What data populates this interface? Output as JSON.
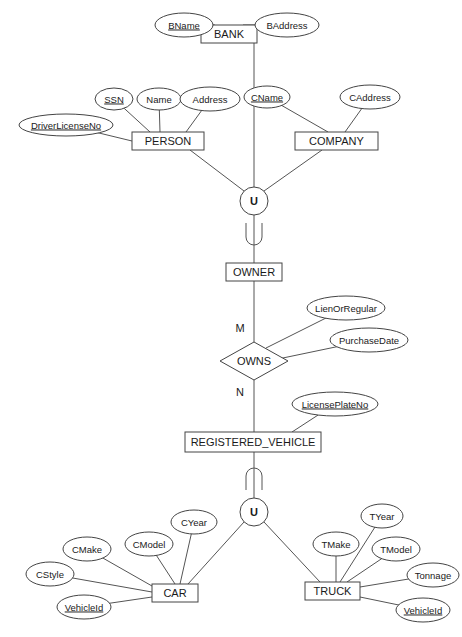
{
  "diagram": {
    "type": "EER diagram",
    "colors": {
      "stroke": "#444444",
      "text": "#1a1a1a",
      "background": "#ffffff"
    },
    "entities": [
      {
        "id": "bank",
        "label": "BANK",
        "x": 201,
        "y": 25,
        "w": 56,
        "h": 18
      },
      {
        "id": "person",
        "label": "PERSON",
        "x": 132,
        "y": 132,
        "w": 72,
        "h": 18
      },
      {
        "id": "company",
        "label": "COMPANY",
        "x": 295,
        "y": 132,
        "w": 83,
        "h": 18
      },
      {
        "id": "owner",
        "label": "OWNER",
        "x": 226,
        "y": 263,
        "w": 56,
        "h": 18
      },
      {
        "id": "registered_vehicle",
        "label": "REGISTERED_VEHICLE",
        "x": 185,
        "y": 432,
        "w": 136,
        "h": 20
      },
      {
        "id": "car",
        "label": "CAR",
        "x": 152,
        "y": 584,
        "w": 46,
        "h": 18
      },
      {
        "id": "truck",
        "label": "TRUCK",
        "x": 305,
        "y": 582,
        "w": 55,
        "h": 18
      }
    ],
    "attributes": [
      {
        "id": "bname",
        "label": "BName",
        "key": true,
        "cx": 184,
        "cy": 25,
        "rx": 29,
        "ry": 12,
        "to": [
          215,
          25
        ]
      },
      {
        "id": "baddress",
        "label": "BAddress",
        "key": false,
        "cx": 287,
        "cy": 25,
        "rx": 32,
        "ry": 12,
        "to": [
          243,
          25
        ]
      },
      {
        "id": "ssn",
        "label": "SSN",
        "key": true,
        "cx": 114,
        "cy": 99,
        "rx": 19,
        "ry": 11,
        "to": [
          150,
          132
        ]
      },
      {
        "id": "name",
        "label": "Name",
        "key": false,
        "cx": 159,
        "cy": 99,
        "rx": 22,
        "ry": 11,
        "to": [
          160,
          132
        ]
      },
      {
        "id": "address",
        "label": "Address",
        "key": false,
        "cx": 210,
        "cy": 99,
        "rx": 30,
        "ry": 12,
        "to": [
          186,
          132
        ]
      },
      {
        "id": "driverlicenseno",
        "label": "DriverLicenseNo",
        "key": true,
        "cx": 66,
        "cy": 125,
        "rx": 47,
        "ry": 11,
        "to": [
          132,
          141
        ]
      },
      {
        "id": "cname",
        "label": "CName",
        "key": true,
        "cx": 267,
        "cy": 97,
        "rx": 23,
        "ry": 11,
        "to": [
          328,
          132
        ]
      },
      {
        "id": "caddress",
        "label": "CAddress",
        "key": false,
        "cx": 370,
        "cy": 97,
        "rx": 30,
        "ry": 12,
        "to": [
          345,
          132
        ]
      },
      {
        "id": "lienorregular",
        "label": "LienOrRegular",
        "key": false,
        "cx": 346,
        "cy": 308,
        "rx": 39,
        "ry": 12,
        "to": [
          266,
          348
        ]
      },
      {
        "id": "purchasedate",
        "label": "PurchaseDate",
        "key": false,
        "cx": 369,
        "cy": 340,
        "rx": 39,
        "ry": 12,
        "to": [
          278,
          359
        ]
      },
      {
        "id": "licenseplateno",
        "label": "LicensePlateNo",
        "key": true,
        "cx": 335,
        "cy": 404,
        "rx": 43,
        "ry": 12,
        "to": [
          292,
          432
        ]
      },
      {
        "id": "cyear",
        "label": "CYear",
        "key": false,
        "cx": 194,
        "cy": 522,
        "rx": 23,
        "ry": 12,
        "to": [
          180,
          584
        ]
      },
      {
        "id": "cmodel",
        "label": "CModel",
        "key": false,
        "cx": 149,
        "cy": 544,
        "rx": 24,
        "ry": 12,
        "to": [
          175,
          584
        ]
      },
      {
        "id": "cmake",
        "label": "CMake",
        "key": false,
        "cx": 87,
        "cy": 549,
        "rx": 24,
        "ry": 12,
        "to": [
          152,
          586
        ]
      },
      {
        "id": "cstyle",
        "label": "CStyle",
        "key": false,
        "cx": 50,
        "cy": 574,
        "rx": 24,
        "ry": 12,
        "to": [
          152,
          592
        ]
      },
      {
        "id": "vehicleid_car",
        "label": "VehicleId",
        "key": true,
        "cx": 84,
        "cy": 607,
        "rx": 27,
        "ry": 12,
        "to": [
          152,
          597
        ]
      },
      {
        "id": "tyear",
        "label": "TYear",
        "key": false,
        "cx": 382,
        "cy": 516,
        "rx": 21,
        "ry": 12,
        "to": [
          340,
          582
        ]
      },
      {
        "id": "tmake",
        "label": "TMake",
        "key": false,
        "cx": 336,
        "cy": 544,
        "rx": 23,
        "ry": 12,
        "to": [
          336,
          582
        ]
      },
      {
        "id": "tmodel",
        "label": "TModel",
        "key": false,
        "cx": 396,
        "cy": 549,
        "rx": 24,
        "ry": 12,
        "to": [
          347,
          582
        ]
      },
      {
        "id": "tonnage",
        "label": "Tonnage",
        "key": false,
        "cx": 433,
        "cy": 575,
        "rx": 26,
        "ry": 12,
        "to": [
          360,
          587
        ]
      },
      {
        "id": "vehicleid_truck",
        "label": "VehicleId",
        "key": true,
        "cx": 423,
        "cy": 610,
        "rx": 27,
        "ry": 12,
        "to": [
          360,
          597
        ]
      }
    ],
    "relationships": [
      {
        "id": "owns",
        "label": "OWNS",
        "cx": 254,
        "cy": 361,
        "hw": 34,
        "hh": 19
      }
    ],
    "union_types": [
      {
        "id": "union_owner",
        "symbol": "U",
        "cx": 254,
        "cy": 201,
        "r": 14
      },
      {
        "id": "union_vehicle",
        "symbol": "U",
        "cx": 254,
        "cy": 512,
        "r": 14
      }
    ],
    "subset_symbols": [
      {
        "id": "subset_owner",
        "cx": 254,
        "cy": 237,
        "orientation": "up"
      },
      {
        "id": "subset_vehicle",
        "cx": 254,
        "cy": 476,
        "orientation": "down"
      }
    ],
    "cardinalities": [
      {
        "id": "card_m",
        "label": "M",
        "x": 240,
        "y": 328
      },
      {
        "id": "card_n",
        "label": "N",
        "x": 240,
        "y": 392
      }
    ],
    "lines": [
      {
        "from": [
          254,
          43
        ],
        "to": [
          254,
          187
        ]
      },
      {
        "from": [
          190,
          150
        ],
        "to": [
          244,
          191
        ]
      },
      {
        "from": [
          322,
          150
        ],
        "to": [
          264,
          191
        ]
      },
      {
        "from": [
          254,
          215
        ],
        "to": [
          254,
          263
        ]
      },
      {
        "from": [
          254,
          281
        ],
        "to": [
          254,
          342
        ]
      },
      {
        "from": [
          254,
          380
        ],
        "to": [
          254,
          432
        ]
      },
      {
        "from": [
          254,
          452
        ],
        "to": [
          254,
          498
        ]
      },
      {
        "from": [
          244,
          522
        ],
        "to": [
          188,
          584
        ]
      },
      {
        "from": [
          264,
          522
        ],
        "to": [
          320,
          582
        ]
      }
    ]
  }
}
